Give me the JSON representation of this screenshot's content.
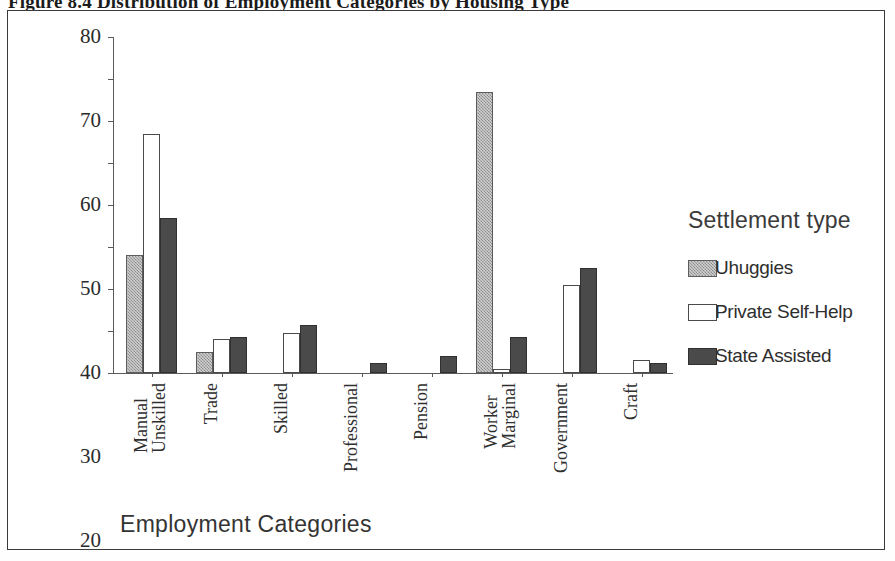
{
  "figure": {
    "caption": "Figure 8.4  Distribution of Employment Categories by Housing Type"
  },
  "axis": {
    "x_title": "Employment Categories",
    "y_ticks": [
      "0",
      "10",
      "20",
      "30",
      "40",
      "50",
      "60",
      "70",
      "80"
    ]
  },
  "legend": {
    "title": "Settlement type",
    "items": [
      {
        "label": "Uhuggies",
        "swatch": "light-grey-textured",
        "color": "#a8a8a8"
      },
      {
        "label": "Private Self-Help",
        "swatch": "white-outline",
        "color": "#ffffff"
      },
      {
        "label": "State Assisted",
        "swatch": "dark-grey-solid",
        "color": "#4a4a4a"
      }
    ]
  },
  "categories_display": [
    {
      "line1": "Unskilled",
      "line2": "Manual"
    },
    {
      "line1": "Trade",
      "line2": ""
    },
    {
      "line1": "Skilled",
      "line2": ""
    },
    {
      "line1": "Professional",
      "line2": ""
    },
    {
      "line1": "Pension",
      "line2": ""
    },
    {
      "line1": "Marginal",
      "line2": "Worker"
    },
    {
      "line1": "Government",
      "line2": ""
    },
    {
      "line1": "Craft",
      "line2": ""
    }
  ],
  "chart_data": {
    "type": "bar",
    "title": "Figure 8.4  Distribution of Employment Categories by Housing Type",
    "xlabel": "Employment Categories",
    "ylabel": "",
    "ylim": [
      0,
      80
    ],
    "ytick_step": 10,
    "grid": false,
    "legend_position": "right",
    "legend_title": "Settlement type",
    "categories": [
      "Unskilled Manual",
      "Trade",
      "Skilled",
      "Professional",
      "Pension",
      "Marginal Worker",
      "Government",
      "Craft"
    ],
    "series": [
      {
        "name": "Uhuggies",
        "color": "#a8a8a8",
        "values": [
          28,
          5,
          0,
          0,
          0,
          67,
          0,
          0
        ]
      },
      {
        "name": "Private Self-Help",
        "color": "#ffffff",
        "values": [
          57,
          8,
          9.5,
          0,
          0,
          1,
          21,
          3
        ]
      },
      {
        "name": "State Assisted",
        "color": "#4a4a4a",
        "values": [
          37,
          8.5,
          11.5,
          2.5,
          4,
          8.5,
          25,
          2.5
        ]
      }
    ]
  }
}
